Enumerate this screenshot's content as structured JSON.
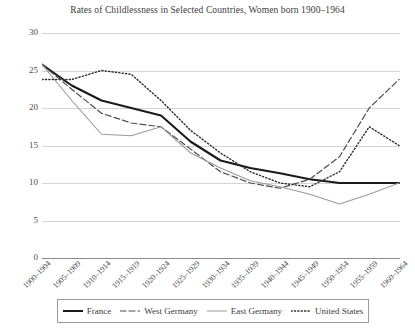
{
  "chart_data": {
    "type": "line",
    "title": "Rates of Childlessness in Selected Countries, Women born 1900–1964",
    "xlabel": "",
    "ylabel": "",
    "ylim": [
      0,
      30
    ],
    "yticks": [
      0,
      5,
      10,
      15,
      20,
      25,
      30
    ],
    "grid": true,
    "legend_position": "bottom",
    "categories": [
      "1900–1904",
      "1905–1909",
      "1910–1914",
      "1915–1919",
      "1920–1924",
      "1925–1929",
      "1930–1934",
      "1935–1939",
      "1940–1944",
      "1945–1949",
      "1950–1954",
      "1955–1959",
      "1960–1964"
    ],
    "series": [
      {
        "name": "France",
        "style": "solid-thick",
        "color": "#1a1a1a",
        "values": [
          25.8,
          23.0,
          21.0,
          20.0,
          19.0,
          15.5,
          13.0,
          12.0,
          11.3,
          10.5,
          10.0,
          10.0,
          10.0
        ]
      },
      {
        "name": "West Germany",
        "style": "dashed",
        "color": "#4d4d4d",
        "values": [
          25.8,
          22.5,
          19.3,
          18.0,
          17.5,
          14.5,
          11.5,
          10.0,
          9.3,
          10.5,
          13.5,
          20.0,
          23.8
        ]
      },
      {
        "name": "East Germany",
        "style": "solid-thin",
        "color": "#9a9a9a",
        "values": [
          25.8,
          21.0,
          16.5,
          16.3,
          17.5,
          14.0,
          12.0,
          10.3,
          9.5,
          8.5,
          7.2,
          8.5,
          10.0
        ]
      },
      {
        "name": "United States",
        "style": "dotted",
        "color": "#2e2e2e",
        "values": [
          23.8,
          23.8,
          25.0,
          24.5,
          21.0,
          17.0,
          14.0,
          11.5,
          10.0,
          9.5,
          11.5,
          17.5,
          15.0
        ]
      }
    ]
  },
  "legend": {
    "items": [
      {
        "label": "France"
      },
      {
        "label": "West Germany"
      },
      {
        "label": "East Germany"
      },
      {
        "label": "United States"
      }
    ]
  }
}
